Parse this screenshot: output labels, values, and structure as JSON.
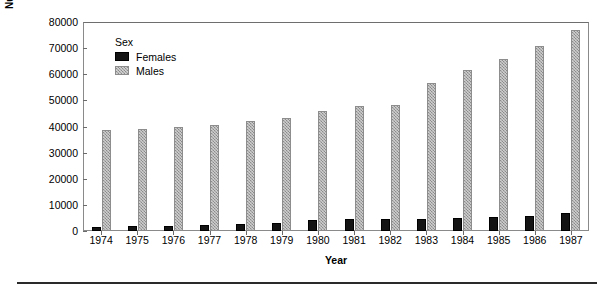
{
  "chart_data": {
    "type": "bar",
    "title": "",
    "xlabel": "Year",
    "ylabel": "Number of Adults Charged",
    "categories": [
      "1974",
      "1975",
      "1976",
      "1977",
      "1978",
      "1979",
      "1980",
      "1981",
      "1982",
      "1983",
      "1984",
      "1985",
      "1986",
      "1987"
    ],
    "series": [
      {
        "name": "Females",
        "color": "#141414",
        "values": [
          1700,
          1800,
          2000,
          2200,
          2600,
          3200,
          4100,
          4700,
          4800,
          4800,
          5100,
          5300,
          5900,
          6800
        ]
      },
      {
        "name": "Males",
        "color": "#a6a6a6",
        "values": [
          38800,
          39200,
          39800,
          40700,
          42000,
          43300,
          46000,
          48000,
          48200,
          56700,
          61500,
          65800,
          71000,
          76800
        ]
      }
    ],
    "ylim": [
      0,
      80000
    ],
    "yticks": [
      0,
      10000,
      20000,
      30000,
      40000,
      50000,
      60000,
      70000,
      80000
    ],
    "ytick_labels": [
      "0",
      "10000",
      "20000",
      "30000",
      "40000",
      "50000",
      "60000",
      "70000",
      "80000"
    ],
    "grid": false,
    "legend": {
      "title": "Sex",
      "position": "inside-top-left",
      "entries": [
        "Females",
        "Males"
      ]
    }
  },
  "axes": {
    "y_title": "Number of Adults Charged",
    "x_title": "Year"
  },
  "legend": {
    "title": "Sex",
    "female_label": "Females",
    "male_label": "Males"
  },
  "colors": {
    "female": "#141414",
    "male": "#a6a6a6",
    "frame": "#8a8a8a",
    "text": "#000000",
    "rule": "#2a2a2a"
  }
}
